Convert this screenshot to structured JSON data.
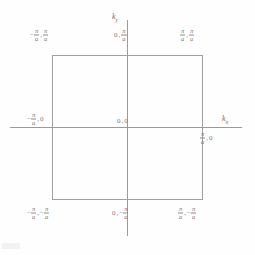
{
  "figure": {
    "background_color": "#fefefe",
    "line_color": "#a0a0a0",
    "text_color": "#7a7a7a"
  },
  "axes": {
    "horizontal": {
      "name": "k",
      "subscript": "x"
    },
    "vertical": {
      "name": "k",
      "subscript": "y"
    }
  },
  "symbols": {
    "pi": "π",
    "a": "a",
    "minus": "−",
    "comma": ",",
    "zero": "0"
  },
  "labels": {
    "top_left": {
      "x": "-π/a",
      "y": "π/a",
      "text": "-π/a , π/a"
    },
    "top_center": {
      "x": "0",
      "y": "π/a",
      "text": "0 , π/a"
    },
    "top_right": {
      "x": "π/a",
      "y": "π/a",
      "text": "π/a , π/a"
    },
    "middle_left": {
      "x": "-π/a",
      "y": "0",
      "text": "-π/a , 0"
    },
    "center": {
      "x": "0",
      "y": "0",
      "text": "0 , 0"
    },
    "middle_right": {
      "x": "π/a",
      "y": "0",
      "text": "π/a , 0"
    },
    "bottom_left": {
      "x": "-π/a",
      "y": "-π/a",
      "text": "-π/a , -π/a"
    },
    "bottom_center": {
      "x": "0",
      "y": "-π/a",
      "text": "0 , -π/a"
    },
    "bottom_right": {
      "x": "π/a",
      "y": "-π/a",
      "text": "π/a , -π/a"
    }
  },
  "chart_data": {
    "type": "scatter",
    "xlabel": "k_x",
    "ylabel": "k_y",
    "xlim": [
      "-π/a",
      "π/a"
    ],
    "ylim": [
      "-π/a",
      "π/a"
    ],
    "grid": false,
    "legend": "none",
    "annotations": [
      "-π/a , π/a",
      "0 , π/a",
      "π/a , π/a",
      "-π/a , 0",
      "0 , 0",
      "π/a , 0",
      "-π/a , -π/a",
      "0 , -π/a",
      "π/a , -π/a"
    ],
    "shapes": [
      {
        "kind": "rectangle",
        "name": "first-brillouin-zone",
        "corners": [
          [
            "-π/a",
            "π/a"
          ],
          [
            "π/a",
            "π/a"
          ],
          [
            "π/a",
            "-π/a"
          ],
          [
            "-π/a",
            "-π/a"
          ]
        ]
      }
    ]
  }
}
